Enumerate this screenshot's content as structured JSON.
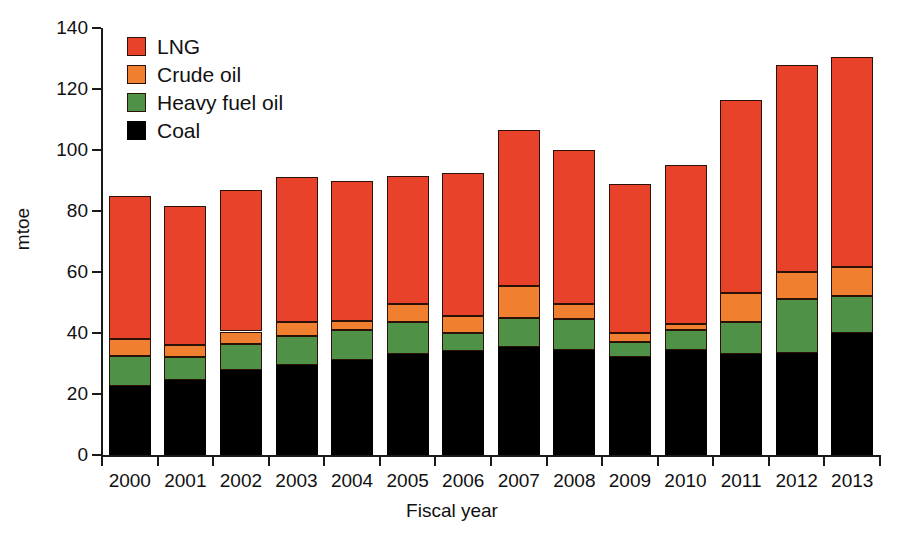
{
  "chart_data": {
    "type": "bar",
    "subtype": "stacked-bar",
    "title": "",
    "xlabel": "Fiscal year",
    "ylabel": "mtoe",
    "categories": [
      "2000",
      "2001",
      "2002",
      "2003",
      "2004",
      "2005",
      "2006",
      "2007",
      "2008",
      "2009",
      "2010",
      "2011",
      "2012",
      "2013"
    ],
    "series": [
      {
        "name": "Coal",
        "color": "#000000",
        "values": [
          22.6,
          24.5,
          28.0,
          29.5,
          31.0,
          33.0,
          34.0,
          35.5,
          34.5,
          32.0,
          34.5,
          33.0,
          33.5,
          40.0
        ]
      },
      {
        "name": "Heavy fuel oil",
        "color": "#4E9147",
        "values": [
          9.9,
          7.5,
          8.5,
          9.5,
          10.0,
          10.5,
          6.0,
          9.5,
          10.0,
          5.0,
          6.5,
          10.5,
          17.5,
          12.0
        ]
      },
      {
        "name": "Crude oil",
        "color": "#F08030",
        "values": [
          5.5,
          4.0,
          4.0,
          4.5,
          3.0,
          6.0,
          5.5,
          10.5,
          5.0,
          3.0,
          2.0,
          9.5,
          9.0,
          9.5
        ]
      },
      {
        "name": "LNG",
        "color": "#E8432A",
        "values": [
          47.0,
          45.5,
          46.5,
          47.5,
          46.0,
          42.0,
          47.0,
          51.0,
          50.5,
          49.0,
          52.0,
          63.5,
          68.0,
          69.0
        ]
      }
    ],
    "totals": [
      85.0,
      81.5,
      87.0,
      91.0,
      90.0,
      91.5,
      92.5,
      106.5,
      100.0,
      89.0,
      95.0,
      116.5,
      128.0,
      130.5
    ],
    "ylim": [
      0,
      140
    ],
    "yticks": [
      0,
      20,
      40,
      60,
      80,
      100,
      120,
      140
    ],
    "grid": false,
    "legend_position": "top-left",
    "legend_order": [
      "LNG",
      "Crude oil",
      "Heavy fuel oil",
      "Coal"
    ]
  },
  "axes": {
    "y_title": "mtoe",
    "x_title": "Fiscal year",
    "y_tick_labels": [
      "0",
      "20",
      "40",
      "60",
      "80",
      "100",
      "120",
      "140"
    ],
    "x_tick_labels": [
      "2000",
      "2001",
      "2002",
      "2003",
      "2004",
      "2005",
      "2006",
      "2007",
      "2008",
      "2009",
      "2010",
      "2011",
      "2012",
      "2013"
    ]
  },
  "legend": {
    "items": [
      {
        "label": "LNG",
        "color": "#E8432A"
      },
      {
        "label": "Crude oil",
        "color": "#F08030"
      },
      {
        "label": "Heavy fuel oil",
        "color": "#4E9147"
      },
      {
        "label": "Coal",
        "color": "#000000"
      }
    ]
  }
}
